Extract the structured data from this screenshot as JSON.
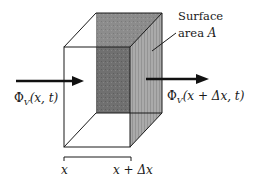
{
  "diagram": {
    "type": "control-volume flux diagram",
    "surface_label": {
      "line1": "Surface",
      "line2_prefix": "area ",
      "line2_var": "A"
    },
    "inflow_label": {
      "symbol": "Φ",
      "subscript": "V",
      "args": "(x, t)"
    },
    "outflow_label": {
      "symbol": "Φ",
      "subscript": "V",
      "args": "(x + Δx, t)"
    },
    "bottom_labels": {
      "left": "x",
      "right": "x + Δx"
    },
    "colors": {
      "line": "#1a1a1a",
      "back_face": "#6f6f6f",
      "back_face_upper": "#8a8a8a",
      "right_face": "#a9a9a9",
      "background": "#ffffff"
    }
  }
}
